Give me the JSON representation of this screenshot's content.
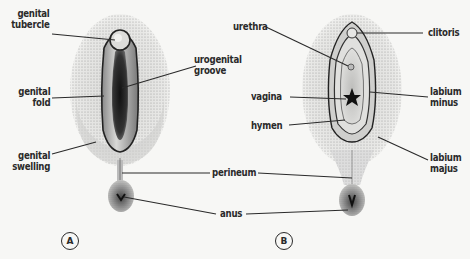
{
  "figure": {
    "panels": [
      {
        "id": "A",
        "label": "A",
        "description": "early undifferentiated stage"
      },
      {
        "id": "B",
        "label": "B",
        "description": "differentiated female stage"
      }
    ],
    "labels_a": {
      "genital_tubercle": [
        "genital",
        "tubercle"
      ],
      "genital_fold": [
        "genital",
        "fold"
      ],
      "genital_swelling": [
        "genital",
        "swelling"
      ],
      "urogenital_groove": [
        "urogenital",
        "groove"
      ]
    },
    "labels_shared": {
      "perineum": "perineum",
      "anus": "anus"
    },
    "labels_b": {
      "urethra": "urethra",
      "vagina": "vagina",
      "hymen": "hymen",
      "clitoris": "clitoris",
      "labium_minus": [
        "labium",
        "minus"
      ],
      "labium_majus": [
        "labium",
        "majus"
      ]
    },
    "colors": {
      "ink": "#2a2a2a",
      "background": "#f7f7f5",
      "stipple": "#8a8a8a"
    }
  }
}
